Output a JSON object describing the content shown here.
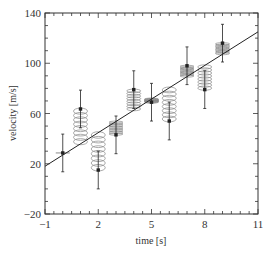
{
  "chart_data": {
    "type": "scatter",
    "title": "",
    "xlabel": "time [s]",
    "ylabel": "velocity [m/s]",
    "xlim": [
      -1,
      11
    ],
    "ylim": [
      -20,
      140
    ],
    "xticks": [
      -1,
      2,
      5,
      8,
      11
    ],
    "yticks": [
      -20,
      20,
      60,
      100,
      140
    ],
    "x_minor_step": 0.5,
    "y_minor_step": 10,
    "grid": false,
    "legend": null,
    "series": [
      {
        "name": "measurements",
        "kind": "errorbar",
        "x": [
          0,
          1,
          2,
          3,
          4,
          5,
          6,
          7,
          8,
          9
        ],
        "y": [
          28.6,
          63.6,
          15.0,
          43.0,
          79.0,
          69.0,
          54.0,
          98.0,
          79.0,
          116.0
        ],
        "yerr": [
          15,
          15,
          15,
          15,
          15,
          15,
          15,
          15,
          15,
          15
        ]
      },
      {
        "name": "linear fit",
        "kind": "line",
        "x": [
          -1,
          11
        ],
        "y": [
          18.0,
          125.0
        ]
      },
      {
        "name": "residual springs",
        "kind": "spring",
        "description": "coil springs connecting each data point to the fit line"
      }
    ],
    "colors": {
      "axis": "#333333",
      "data": "#222222",
      "fit_line": "#222222",
      "spring": "#888888"
    }
  }
}
